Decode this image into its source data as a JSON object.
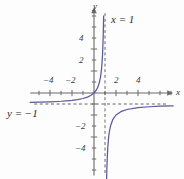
{
  "chart_data": {
    "type": "line",
    "title": "",
    "xlabel": "x",
    "ylabel": "y",
    "xlim": [
      -5.8,
      7.2
    ],
    "ylim": [
      -7.5,
      7.8
    ],
    "grid": false,
    "legend": null,
    "function": "y = 1/(x-1) - 1",
    "x_ticks": [
      -4,
      -2,
      2,
      4
    ],
    "y_ticks": [
      4,
      2,
      -2,
      -4
    ],
    "x_tick_labels": [
      "-4",
      "-2",
      "2",
      "4"
    ],
    "y_tick_labels": [
      "4",
      "2",
      "-2",
      "-4"
    ],
    "minor_tick_step": 1,
    "annotations": [
      {
        "name": "vertical-asymptote-label",
        "text": "x = 1",
        "x": 1.9,
        "y": 6.6
      },
      {
        "name": "horizontal-asymptote-label",
        "text": "y = -1",
        "x": -5.6,
        "y": -1.9
      }
    ],
    "asymptotes": [
      {
        "name": "vertical-asymptote",
        "type": "vertical",
        "value": 1,
        "style": "dashed"
      },
      {
        "name": "horizontal-asymptote",
        "type": "horizontal",
        "value": -1,
        "style": "dashed"
      }
    ],
    "series": [
      {
        "name": "left-branch",
        "comment": "x < 1 branch, approaches y=-1 from above on the left and dives to +inf near x=1",
        "points": [
          [
            -5.8,
            -0.853
          ],
          [
            -5.0,
            -0.833
          ],
          [
            -4.0,
            -0.8
          ],
          [
            -3.0,
            -0.75
          ],
          [
            -2.5,
            -0.714
          ],
          [
            -2.0,
            -0.667
          ],
          [
            -1.5,
            -0.6
          ],
          [
            -1.0,
            -0.5
          ],
          [
            -0.6,
            -0.375
          ],
          [
            -0.3,
            -0.231
          ],
          [
            0.0,
            0.0
          ],
          [
            0.2,
            0.25
          ],
          [
            0.35,
            0.538
          ],
          [
            0.5,
            1.0
          ],
          [
            0.6,
            1.5
          ],
          [
            0.7,
            2.333
          ],
          [
            0.78,
            3.545
          ],
          [
            0.84,
            5.25
          ],
          [
            0.875,
            7.0
          ]
        ]
      },
      {
        "name": "right-branch",
        "comment": "x > 1 branch, rises from -inf near x=1 and approaches y=-1 from below",
        "points": [
          [
            1.13,
            -8.69
          ],
          [
            1.16,
            -7.25
          ],
          [
            1.2,
            -6.0
          ],
          [
            1.25,
            -5.0
          ],
          [
            1.33,
            -4.0
          ],
          [
            1.4,
            -3.5
          ],
          [
            1.5,
            -3.0
          ],
          [
            1.7,
            -2.43
          ],
          [
            2.0,
            -2.0
          ],
          [
            2.5,
            -1.667
          ],
          [
            3.0,
            -1.5
          ],
          [
            4.0,
            -1.333
          ],
          [
            5.0,
            -1.25
          ],
          [
            6.0,
            -1.2
          ],
          [
            7.2,
            -1.161
          ]
        ]
      }
    ],
    "colors": {
      "curve": "#5a5a9c",
      "axis": "#6b6b6b",
      "asymptote": "#555555",
      "label": "#2b2b2b",
      "background": "#fdfdfd"
    }
  },
  "labels": {
    "x_axis_name": "x",
    "y_axis_name": "y",
    "vertical_asymptote": "x = 1",
    "horizontal_asymptote": "y = −1",
    "x_tick_neg4": "−4",
    "x_tick_neg2": "−2",
    "x_tick_pos2": "2",
    "x_tick_pos4": "4",
    "y_tick_pos4": "4",
    "y_tick_pos2": "2",
    "y_tick_neg2": "−2",
    "y_tick_neg4": "−4"
  }
}
